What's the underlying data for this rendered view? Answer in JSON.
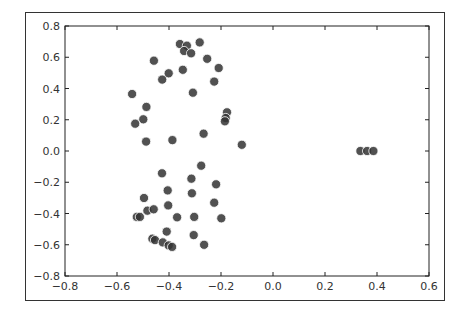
{
  "chart_data": {
    "type": "scatter",
    "title": "",
    "xlabel": "",
    "ylabel": "",
    "xlim": [
      -0.8,
      0.6
    ],
    "ylim": [
      -0.8,
      0.8
    ],
    "grid": false,
    "legend": null,
    "x_ticks": [
      "-0.8",
      "-0.6",
      "-0.4",
      "-0.2",
      "0.0",
      "0.2",
      "0.4",
      "0.6"
    ],
    "y_ticks": [
      "0.8",
      "0.6",
      "0.4",
      "0.2",
      "0.0",
      "-0.2",
      "-0.4",
      "-0.6",
      "-0.8"
    ],
    "marker_color": "#333333",
    "series": [
      {
        "name": "points",
        "points": [
          [
            -0.358,
            0.685
          ],
          [
            -0.331,
            0.674
          ],
          [
            -0.342,
            0.64
          ],
          [
            -0.315,
            0.625
          ],
          [
            -0.282,
            0.695
          ],
          [
            -0.253,
            0.59
          ],
          [
            -0.458,
            0.578
          ],
          [
            -0.209,
            0.531
          ],
          [
            -0.347,
            0.52
          ],
          [
            -0.401,
            0.497
          ],
          [
            -0.426,
            0.457
          ],
          [
            -0.226,
            0.444
          ],
          [
            -0.308,
            0.373
          ],
          [
            -0.542,
            0.365
          ],
          [
            -0.487,
            0.282
          ],
          [
            -0.177,
            0.248
          ],
          [
            -0.499,
            0.203
          ],
          [
            -0.182,
            0.211
          ],
          [
            -0.185,
            0.19
          ],
          [
            -0.53,
            0.175
          ],
          [
            -0.267,
            0.111
          ],
          [
            -0.387,
            0.07
          ],
          [
            -0.488,
            0.06
          ],
          [
            -0.12,
            0.04
          ],
          [
            -0.276,
            -0.094
          ],
          [
            -0.427,
            -0.143
          ],
          [
            -0.314,
            -0.177
          ],
          [
            -0.219,
            -0.213
          ],
          [
            -0.405,
            -0.252
          ],
          [
            -0.312,
            -0.271
          ],
          [
            -0.496,
            -0.301
          ],
          [
            -0.226,
            -0.331
          ],
          [
            -0.403,
            -0.348
          ],
          [
            -0.483,
            -0.382
          ],
          [
            -0.459,
            -0.373
          ],
          [
            -0.524,
            -0.422
          ],
          [
            -0.512,
            -0.422
          ],
          [
            -0.369,
            -0.424
          ],
          [
            -0.303,
            -0.422
          ],
          [
            -0.199,
            -0.431
          ],
          [
            -0.409,
            -0.516
          ],
          [
            -0.305,
            -0.538
          ],
          [
            -0.464,
            -0.561
          ],
          [
            -0.454,
            -0.57
          ],
          [
            -0.424,
            -0.585
          ],
          [
            -0.401,
            -0.604
          ],
          [
            -0.388,
            -0.614
          ],
          [
            -0.265,
            -0.6
          ],
          [
            0.336,
            0.0
          ],
          [
            0.362,
            0.0
          ],
          [
            0.386,
            0.0
          ]
        ]
      }
    ]
  }
}
